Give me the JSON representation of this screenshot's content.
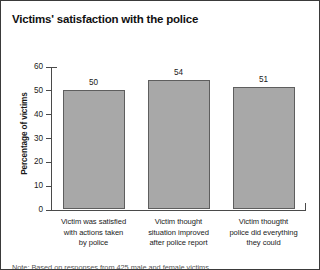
{
  "chart_data": {
    "type": "bar",
    "title": "Victims' satisfaction with the police",
    "xlabel": "",
    "ylabel": "Percentage of victims",
    "ylim": [
      0,
      60
    ],
    "yticks": [
      0,
      10,
      20,
      30,
      40,
      50,
      60
    ],
    "grid": false,
    "legend": "none",
    "categories": [
      "Victim was satisfied with actions taken by police",
      "Victim thought situation improved after police report",
      "Victim thougtht police did everything they could"
    ],
    "category_lines": [
      [
        "Victim was satisfied",
        "with actions taken",
        "by police"
      ],
      [
        "Victim thought",
        "situation improved",
        "after police report"
      ],
      [
        "Victim thougtht",
        "police did everything",
        "they could"
      ]
    ],
    "values": [
      50,
      54,
      51
    ],
    "value_labels": [
      "50",
      "54",
      "51"
    ],
    "bar_color": "#a8a8a8",
    "bar_edge_color": "#5e5e5e",
    "axis_color": "#4a4a4a",
    "text_color": "#1a1a1a",
    "note": "Note: Based on responses from 425 male and female victims"
  }
}
